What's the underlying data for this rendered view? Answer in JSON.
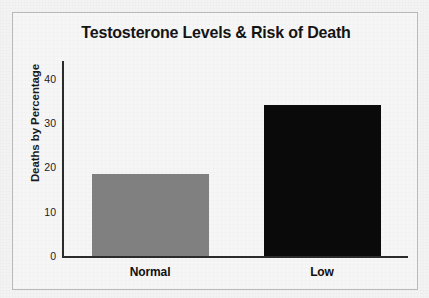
{
  "chart_data": {
    "type": "bar",
    "title": "Testosterone Levels & Risk of Death",
    "xlabel": "",
    "ylabel": "Deaths by Percentage",
    "categories": [
      "Normal",
      "Low"
    ],
    "values": [
      18.5,
      34
    ],
    "series": [
      {
        "name": "Deaths by Percentage",
        "values": [
          18.5,
          34
        ]
      }
    ],
    "bar_colors": [
      "#808080",
      "#0a0a0a"
    ],
    "ylim": [
      0,
      44
    ],
    "yticks": [
      0,
      10,
      20,
      30,
      40
    ],
    "ytick_labels": [
      "0",
      "10",
      "20",
      "30",
      "40"
    ],
    "grid": false,
    "legend": false,
    "legend_position": "none"
  },
  "figure": {
    "background_color": "#f6f6f6",
    "frame_color": "#b9b9b9",
    "axis_color": "#2b2b2b",
    "text_color": "#141414"
  }
}
